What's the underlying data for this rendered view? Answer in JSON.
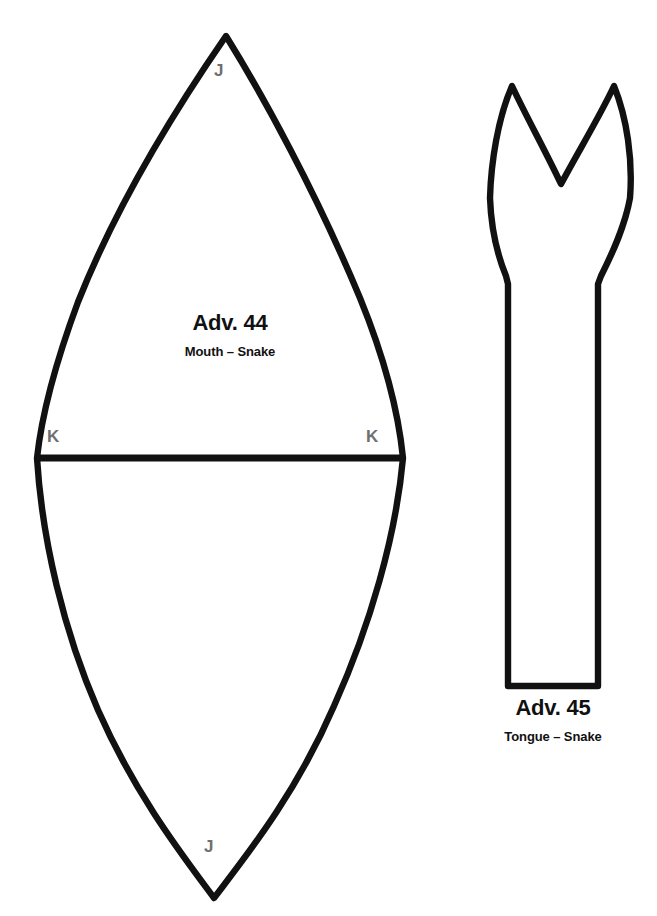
{
  "page": {
    "background_color": "#ffffff",
    "ink_color": "#111111",
    "mark_color": "#6f6f6f",
    "clipped_header_text": "."
  },
  "pieces": [
    {
      "id": "adv-44",
      "title": "Adv. 44",
      "subtitle": "Mouth – Snake",
      "shape": "pointed-oval",
      "marks": [
        {
          "label": "J",
          "position": "top-vertex"
        },
        {
          "label": "K",
          "position": "left-seam-end"
        },
        {
          "label": "K",
          "position": "right-seam-end"
        },
        {
          "label": "J",
          "position": "bottom-vertex"
        }
      ],
      "seam_line": "horizontal"
    },
    {
      "id": "adv-45",
      "title": "Adv. 45",
      "subtitle": "Tongue – Snake",
      "shape": "forked-tongue",
      "marks": [],
      "seam_line": "none"
    }
  ],
  "marks": {
    "j_top": "J",
    "k_left": "K",
    "k_right": "K",
    "j_bottom": "J"
  },
  "labels": {
    "adv44_title": "Adv. 44",
    "adv44_subtitle": "Mouth – Snake",
    "adv45_title": "Adv. 45",
    "adv45_subtitle": "Tongue – Snake"
  }
}
